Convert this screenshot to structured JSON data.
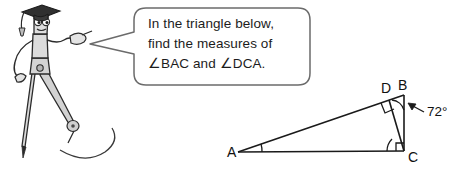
{
  "page": {
    "background_color": "#ffffff",
    "width": 461,
    "height": 170
  },
  "mascot": {
    "name": "compass-character",
    "description": "Cartoon drawing compass wearing a graduation cap, pointing with one hand",
    "body_color": "#d8d8d8",
    "outline_color": "#2b2b2b",
    "cap_color": "#303030"
  },
  "speech_bubble": {
    "border_color": "#6b6b6b",
    "fill_color": "#ffffff",
    "lines": [
      "In the triangle below,",
      "find the measures of",
      "∠BAC and ∠DCA."
    ],
    "line1": "In the triangle below,",
    "line2": "find the measures of",
    "line3": "∠BAC and ∠DCA."
  },
  "diagram": {
    "type": "right-triangle-with-altitude",
    "stroke_color": "#1a1a1a",
    "vertices": {
      "A": "A",
      "B": "B",
      "C": "C",
      "D": "D"
    },
    "given_angle": {
      "label": "72°",
      "at_vertex": "B",
      "value": 72
    },
    "right_angles": [
      {
        "at": "C",
        "between": "BC and AC"
      },
      {
        "at": "D",
        "between": "AB and DC"
      }
    ],
    "marked_angles": [
      {
        "at": "A",
        "name": "BAC"
      },
      {
        "at": "C",
        "name": "DCA"
      }
    ]
  }
}
